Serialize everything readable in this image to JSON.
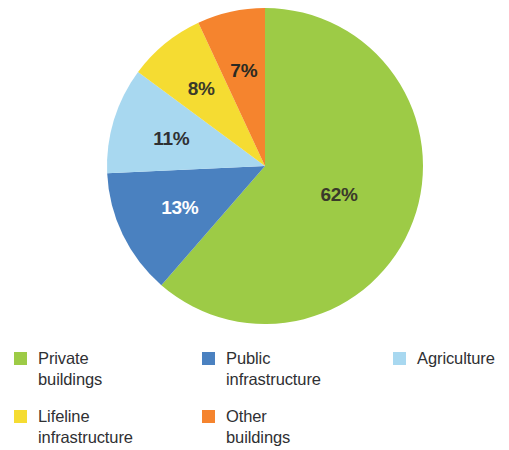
{
  "chart_data": {
    "type": "pie",
    "title": "",
    "subtitle": "",
    "xlabel": "",
    "ylabel": "",
    "grid": false,
    "legend_position": "bottom",
    "units": "percent",
    "start_angle_deg": 0,
    "direction": "clockwise",
    "categories": [
      "Private buildings",
      "Public infrastructure",
      "Agriculture",
      "Lifeline infrastructure",
      "Other buildings"
    ],
    "values": [
      62,
      13,
      11,
      8,
      7
    ],
    "data_labels": [
      "62%",
      "13%",
      "11%",
      "8%",
      "7%"
    ],
    "colors": [
      "#9DCB46",
      "#4A81C0",
      "#A8D8F0",
      "#F5DC32",
      "#F5842E"
    ],
    "label_text_colors": [
      "#3a3a2a",
      "#ffffff",
      "#2f3033",
      "#3a3a2a",
      "#2a2a22"
    ],
    "slices": [
      {
        "label": "Private buildings",
        "value": 62,
        "data_label": "62%",
        "color": "#9DCB46",
        "label_color": "#3a3a2a"
      },
      {
        "label": "Public infrastructure",
        "value": 13,
        "data_label": "13%",
        "color": "#4A81C0",
        "label_color": "#ffffff"
      },
      {
        "label": "Agriculture",
        "value": 11,
        "data_label": "11%",
        "color": "#A8D8F0",
        "label_color": "#2f3033"
      },
      {
        "label": "Lifeline infrastructure",
        "value": 8,
        "data_label": "8%",
        "color": "#F5DC32",
        "label_color": "#3a3a2a"
      },
      {
        "label": "Other buildings",
        "value": 7,
        "data_label": "7%",
        "color": "#F5842E",
        "label_color": "#2a2a22"
      }
    ]
  },
  "legend": {
    "items": [
      {
        "label": "Private\nbuildings",
        "color": "#9DCB46"
      },
      {
        "label": "Public\ninfrastructure",
        "color": "#4A81C0"
      },
      {
        "label": "Agriculture",
        "color": "#A8D8F0"
      },
      {
        "label": "Lifeline\ninfrastructure",
        "color": "#F5DC32"
      },
      {
        "label": "Other\nbuildings",
        "color": "#F5842E"
      }
    ]
  }
}
